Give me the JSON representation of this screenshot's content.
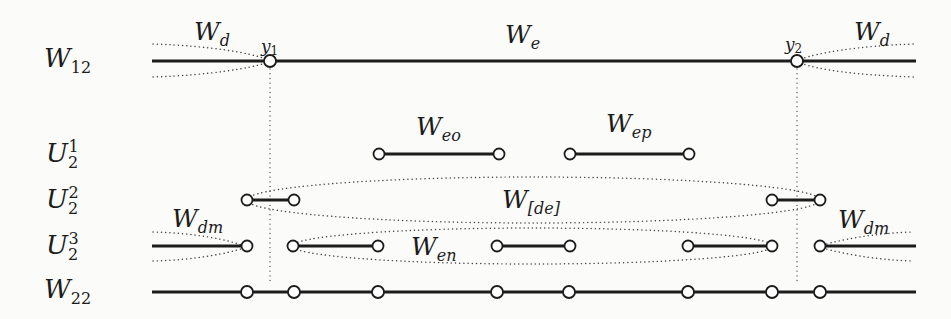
{
  "colors": {
    "ink": "#1c1c1c",
    "dotted_lines": "#474747",
    "background": "#fbfbf9",
    "marker_fill": "#ffffff"
  },
  "row_labels": {
    "w12": {
      "base": "W",
      "sub": "12"
    },
    "u2_1": {
      "base": "U",
      "sub": "2",
      "sup": "1"
    },
    "u2_2": {
      "base": "U",
      "sub": "2",
      "sup": "2"
    },
    "u2_3": {
      "base": "U",
      "sub": "2",
      "sup": "3"
    },
    "w22": {
      "base": "W",
      "sub": "22"
    }
  },
  "word_labels": {
    "wd_left": {
      "base": "W",
      "sub": "d"
    },
    "we": {
      "base": "W",
      "sub": "e"
    },
    "wd_right": {
      "base": "W",
      "sub": "d"
    },
    "weo": {
      "base": "W",
      "sub": "eo"
    },
    "wep": {
      "base": "W",
      "sub": "ep"
    },
    "wde": {
      "base": "W",
      "sub": "[de]"
    },
    "wdm_left": {
      "base": "W",
      "sub": "dm"
    },
    "wen": {
      "base": "W",
      "sub": "en"
    },
    "wdm_right": {
      "base": "W",
      "sub": "dm"
    }
  },
  "point_labels": {
    "y1": {
      "base": "y",
      "sub": "1"
    },
    "y2": {
      "base": "y",
      "sub": "2"
    }
  }
}
